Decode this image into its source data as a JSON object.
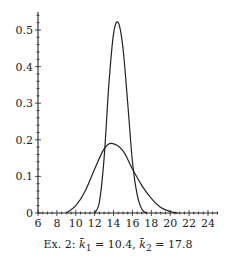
{
  "chart_data": {
    "type": "line",
    "title": "",
    "caption": "Ex. 2: k̄₁ = 10.4, k̄₂ = 17.8",
    "xlabel": "",
    "ylabel": "",
    "xlim": [
      6,
      25
    ],
    "ylim": [
      0,
      0.54
    ],
    "x_ticks": [
      6,
      8,
      10,
      12,
      14,
      16,
      18,
      20,
      22,
      24
    ],
    "y_ticks": [
      0,
      0.1,
      0.2,
      0.3,
      0.4,
      0.5
    ],
    "y_tick_labels": [
      "0",
      "0.1",
      "0.2",
      "0.3",
      "0.4",
      "0.5"
    ],
    "grid": false,
    "legend": null,
    "series": [
      {
        "name": "narrow density",
        "x": [
          12.0,
          12.5,
          13.0,
          13.5,
          14.0,
          14.5,
          15.0,
          15.5,
          16.0,
          16.5,
          17.0,
          17.5
        ],
        "values": [
          0.0,
          0.03,
          0.15,
          0.35,
          0.49,
          0.52,
          0.45,
          0.3,
          0.14,
          0.05,
          0.01,
          0.0
        ]
      },
      {
        "name": "broad density",
        "x": [
          9.0,
          10.0,
          11.0,
          12.0,
          13.0,
          13.8,
          15.0,
          16.0,
          17.0,
          18.0,
          19.0,
          20.0,
          20.8
        ],
        "values": [
          0.0,
          0.02,
          0.06,
          0.12,
          0.175,
          0.19,
          0.17,
          0.12,
          0.075,
          0.04,
          0.015,
          0.004,
          0.0
        ]
      }
    ]
  },
  "caption": {
    "prefix": "Ex. 2: ",
    "k1_value": "10.4",
    "k2_value": "17.8"
  }
}
